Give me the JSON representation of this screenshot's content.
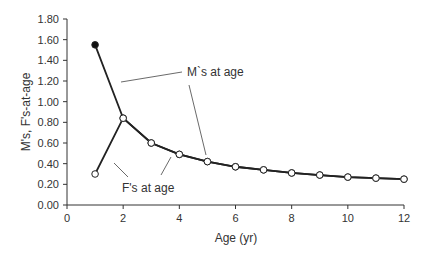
{
  "chart_data": {
    "type": "line",
    "title": "",
    "xlabel": "Age (yr)",
    "ylabel": "M's, F's-at-age",
    "xlim": [
      0,
      12
    ],
    "ylim": [
      0,
      1.8
    ],
    "x_ticks": [
      0,
      2,
      4,
      6,
      8,
      10,
      12
    ],
    "y_ticks": [
      "0.00",
      "0.20",
      "0.40",
      "0.60",
      "0.80",
      "1.00",
      "1.20",
      "1.40",
      "1.60",
      "1.80"
    ],
    "grid": false,
    "legend": "none",
    "series": [
      {
        "name": "M's at age",
        "marker": "circle",
        "x": [
          1,
          2,
          3,
          4,
          5,
          6,
          7,
          8,
          9,
          10,
          11,
          12
        ],
        "values": [
          1.55,
          0.84,
          0.6,
          0.49,
          0.42,
          0.37,
          0.34,
          0.31,
          0.29,
          0.27,
          0.26,
          0.25
        ],
        "first_marker_filled": true
      },
      {
        "name": "F's at age",
        "marker": "circle",
        "x": [
          1,
          2,
          3,
          4,
          5,
          6,
          7,
          8,
          9,
          10,
          11,
          12
        ],
        "values": [
          0.3,
          0.84,
          0.6,
          0.49,
          0.42,
          0.37,
          0.34,
          0.31,
          0.29,
          0.27,
          0.26,
          0.25
        ]
      }
    ],
    "annotations": [
      {
        "text": "M`s at age",
        "x": 4.5,
        "y": 1.08
      },
      {
        "text": "F's at age",
        "x": 2.4,
        "y": 0.12
      }
    ]
  },
  "colors": {
    "line": "#222222",
    "axis": "#333333",
    "marker_fill": "#ffffff",
    "marker_filled": "#111111"
  }
}
